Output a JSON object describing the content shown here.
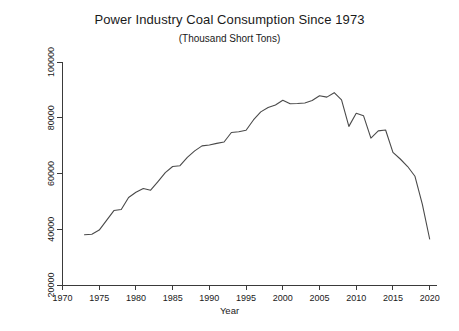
{
  "chart_data": {
    "type": "line",
    "title": "Power Industry Coal Consumption Since 1973",
    "subtitle": "(Thousand Short Tons)",
    "xlabel": "Year",
    "ylabel": "Power Industry Coal Consumption",
    "xlim": [
      1970,
      2021
    ],
    "ylim": [
      20000,
      100000
    ],
    "xticks": [
      1970,
      1975,
      1980,
      1985,
      1990,
      1995,
      2000,
      2005,
      2010,
      2015,
      2020
    ],
    "xtick_labels": [
      "1970",
      "1975",
      "1980",
      "1985",
      "1990",
      "1995",
      "2000",
      "2005",
      "2010",
      "2015",
      "2020"
    ],
    "yticks": [
      20000,
      40000,
      60000,
      80000,
      100000
    ],
    "ytick_labels": [
      "20000",
      "40000",
      "60000",
      "80000",
      "100000"
    ],
    "grid": false,
    "legend": false,
    "line_color": "#4a4a4a",
    "x": [
      1973,
      1974,
      1975,
      1976,
      1977,
      1978,
      1979,
      1980,
      1981,
      1982,
      1983,
      1984,
      1985,
      1986,
      1987,
      1988,
      1989,
      1990,
      1991,
      1992,
      1993,
      1994,
      1995,
      1996,
      1997,
      1998,
      1999,
      2000,
      2001,
      2002,
      2003,
      2004,
      2005,
      2006,
      2007,
      2008,
      2009,
      2010,
      2011,
      2012,
      2013,
      2014,
      2015,
      2016,
      2017,
      2018,
      2019,
      2020
    ],
    "values": [
      38000,
      38200,
      39700,
      43200,
      46700,
      47100,
      51400,
      53300,
      54600,
      54000,
      57100,
      60300,
      62500,
      62800,
      65800,
      68100,
      69900,
      70200,
      70800,
      71300,
      74700,
      75000,
      75500,
      79200,
      82100,
      83700,
      84600,
      86300,
      85000,
      85100,
      85300,
      86200,
      87900,
      87400,
      89000,
      86400,
      76900,
      81600,
      80700,
      72700,
      75300,
      75600,
      67600,
      65200,
      62500,
      59000,
      49000,
      36500
    ],
    "annotations": []
  }
}
